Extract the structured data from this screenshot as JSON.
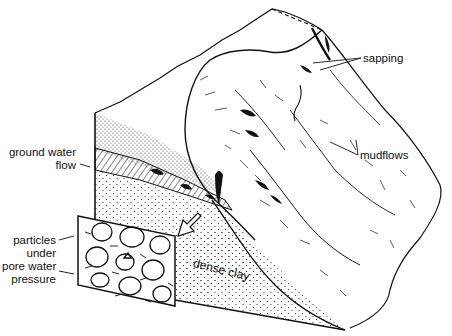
{
  "figure": {
    "type": "block-diagram",
    "colors": {
      "ink": "#111111",
      "background": "#ffffff"
    }
  },
  "labels": {
    "sapping": "sapping",
    "mudflows": "mudflows",
    "ground_water_flow_line1": "ground water",
    "ground_water_flow_line2": "flow",
    "particles_line1": "particles",
    "particles_line2": "under",
    "particles_line3": "pore water",
    "particles_line4": "pressure",
    "dense_clay": "dense clay"
  }
}
